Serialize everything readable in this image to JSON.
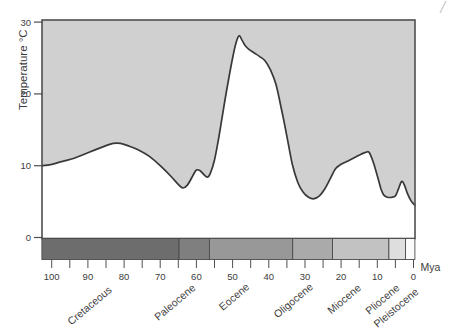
{
  "labels": {
    "x_axis_unit": "Mya"
  },
  "chart_data": {
    "type": "area",
    "title": "",
    "ylabel": "Temperature °C",
    "x_unit": "Mya",
    "x_direction": "reversed_time_left_100_right_0",
    "ylim": [
      0,
      30
    ],
    "xlim": [
      102.7,
      -0.4
    ],
    "y_ticks": [
      0,
      10,
      20,
      30
    ],
    "x_ticks_labeled": [
      100,
      90,
      80,
      70,
      60,
      50,
      40,
      30,
      20,
      10,
      0
    ],
    "x_ticks_minor": [
      95,
      85,
      75,
      65,
      55,
      45,
      35,
      25,
      15,
      5
    ],
    "grid": "off",
    "fill_side": "above-curve",
    "fill_color": "#d0d0d0",
    "line_color": "#383838",
    "frame_color": "#4f4f4f",
    "curve_points_mya_degC": [
      [
        102.7,
        10.0
      ],
      [
        100,
        10.2
      ],
      [
        97,
        10.6
      ],
      [
        94,
        11.0
      ],
      [
        91,
        11.6
      ],
      [
        88,
        12.2
      ],
      [
        85,
        12.8
      ],
      [
        83,
        13.1
      ],
      [
        81,
        13.1
      ],
      [
        79,
        12.8
      ],
      [
        76,
        12.2
      ],
      [
        73,
        11.3
      ],
      [
        70,
        10.0
      ],
      [
        67,
        8.5
      ],
      [
        65,
        7.4
      ],
      [
        63.8,
        6.9
      ],
      [
        62.5,
        7.3
      ],
      [
        61,
        8.6
      ],
      [
        60,
        9.4
      ],
      [
        59,
        9.3
      ],
      [
        58,
        8.8
      ],
      [
        57,
        8.4
      ],
      [
        56.2,
        8.9
      ],
      [
        55,
        10.8
      ],
      [
        53.8,
        14.0
      ],
      [
        52.5,
        18.0
      ],
      [
        51.2,
        21.8
      ],
      [
        50,
        25.0
      ],
      [
        49,
        27.2
      ],
      [
        48.2,
        28.1
      ],
      [
        47.4,
        27.5
      ],
      [
        46.5,
        26.7
      ],
      [
        45.5,
        26.2
      ],
      [
        44,
        25.7
      ],
      [
        42.5,
        25.2
      ],
      [
        41,
        24.6
      ],
      [
        39.5,
        23.3
      ],
      [
        38,
        21.3
      ],
      [
        36.5,
        17.9
      ],
      [
        35,
        14.1
      ],
      [
        33.5,
        10.2
      ],
      [
        32,
        7.7
      ],
      [
        30.5,
        6.3
      ],
      [
        29,
        5.6
      ],
      [
        27.5,
        5.4
      ],
      [
        26,
        5.8
      ],
      [
        24.5,
        6.8
      ],
      [
        23,
        8.2
      ],
      [
        21.5,
        9.6
      ],
      [
        20,
        10.2
      ],
      [
        18,
        10.7
      ],
      [
        16,
        11.2
      ],
      [
        14.5,
        11.6
      ],
      [
        13,
        11.9
      ],
      [
        12.2,
        11.8
      ],
      [
        11,
        10.3
      ],
      [
        10,
        8.6
      ],
      [
        9,
        6.8
      ],
      [
        8.2,
        5.9
      ],
      [
        7.2,
        5.6
      ],
      [
        6,
        5.6
      ],
      [
        5,
        5.8
      ],
      [
        4.2,
        6.7
      ],
      [
        3.3,
        7.8
      ],
      [
        2.6,
        7.4
      ],
      [
        1.8,
        6.3
      ],
      [
        1,
        5.4
      ],
      [
        0.4,
        4.9
      ],
      [
        -0.4,
        4.5
      ]
    ],
    "periods": [
      {
        "name": "Cretaceous",
        "from_mya": 102.7,
        "to_mya": 64.8,
        "color": "#6d6d6d"
      },
      {
        "name": "Paleocene",
        "from_mya": 64.8,
        "to_mya": 56.4,
        "color": "#7f7f7f"
      },
      {
        "name": "Eocene",
        "from_mya": 56.4,
        "to_mya": 33.4,
        "color": "#989898"
      },
      {
        "name": "Oligocene",
        "from_mya": 33.4,
        "to_mya": 22.4,
        "color": "#aaaaaa"
      },
      {
        "name": "Miocene",
        "from_mya": 22.4,
        "to_mya": 6.8,
        "color": "#c2c2c2"
      },
      {
        "name": "Pliocene",
        "from_mya": 6.8,
        "to_mya": 2.2,
        "color": "#dedede"
      },
      {
        "name": "Pleistocene",
        "from_mya": 2.2,
        "to_mya": -0.4,
        "color": "#fafafa"
      }
    ]
  }
}
